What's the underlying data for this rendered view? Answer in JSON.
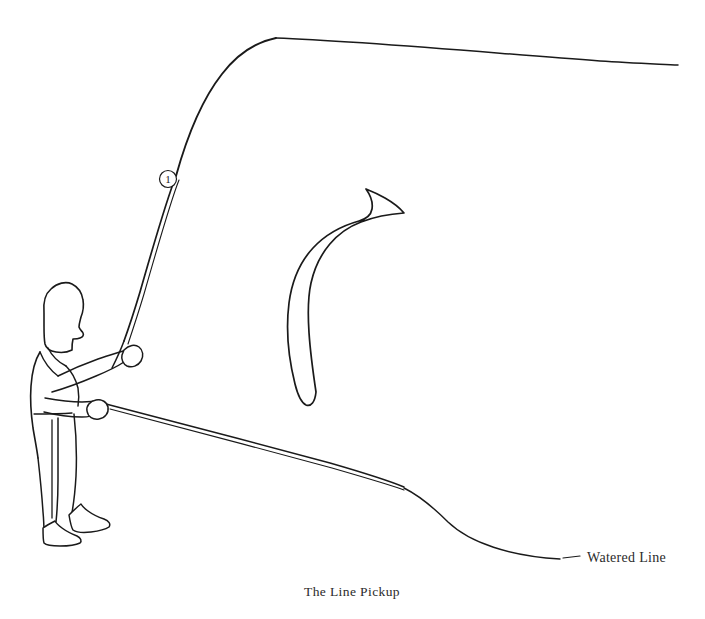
{
  "figure": {
    "caption": "The Line Pickup",
    "background_color": "#ffffff",
    "ink_color": "#1a1a1a"
  },
  "annotations": {
    "watered_line_label": "Watered Line",
    "rod_marker_label": "1"
  },
  "scene": {
    "angler_name": "fly-angler-figure",
    "rod_name": "fly-rod",
    "fly_line_name": "airborne-fly-line",
    "water_line_name": "watered-line-curve",
    "motion_arrow_name": "line-pickup-motion-arrow"
  }
}
